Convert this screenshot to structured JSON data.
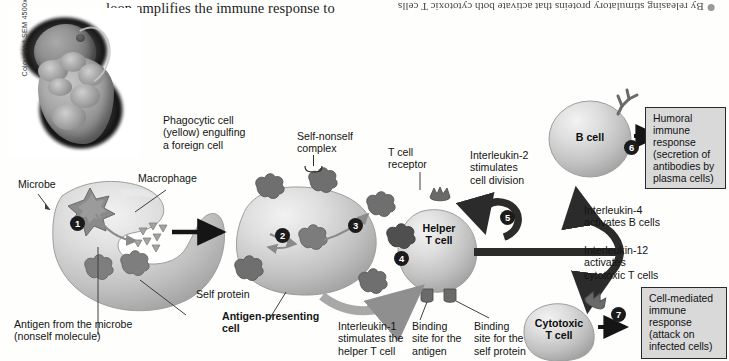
{
  "page": {
    "header_text": "loop amplifies the immune response to",
    "facing_page_caption": "By releasing stimulatory proteins that activate both cytotoxic T cells",
    "sem_credit": "Colourized SEM 4500x"
  },
  "labels": {
    "microbe": "Microbe",
    "macrophage": "Macrophage",
    "phagocytic_cell": "Phagocytic cell\n(yellow) engulfing\na foreign cell",
    "self_protein": "Self protein",
    "antigen_from_microbe": "Antigen from the microbe\n(nonself molecule)",
    "antigen_presenting_cell": "Antigen-presenting\ncell",
    "self_nonself_complex": "Self-nonself\ncomplex",
    "t_cell_receptor": "T cell\nreceptor",
    "interleukin_1": "Interleukin-1\nstimulates the\nhelper T cell",
    "binding_site_antigen": "Binding\nsite for the\nantigen",
    "binding_site_self_protein": "Binding\nsite for the\nself protein",
    "interleukin_2": "Interleukin-2\nstimulates\ncell division",
    "interleukin_4": "Interleukin-4\nactivates B cells",
    "interleukin_12": "Interleukin-12\nactivates\ncytotoxic T cells"
  },
  "cells": {
    "helper_t_cell": "Helper\nT cell",
    "b_cell": "B cell",
    "cytotoxic_t_cell": "Cytotoxic\nT cell"
  },
  "outcomes": {
    "humoral": "Humoral\nimmune\nresponse\n(secretion of\nantibodies by\nplasma cells)",
    "cell_mediated": "Cell-mediated\nimmune\nresponse\n(attack on\ninfected cells)"
  },
  "steps": {
    "s1": "1",
    "s2": "2",
    "s3": "3",
    "s4": "4",
    "s5": "5",
    "s6": "6",
    "s7": "7"
  },
  "colors": {
    "cell_fill_light": "#dcdcdc",
    "cell_fill_dark": "#a3a3a3",
    "receptor": "#6e6e6e",
    "arrow_dark": "#1b1b1b",
    "arrow_gray": "#9a9a9a",
    "box_fill": "#d9d9d9",
    "box_border": "#2a2a2a",
    "text": "#141414"
  }
}
